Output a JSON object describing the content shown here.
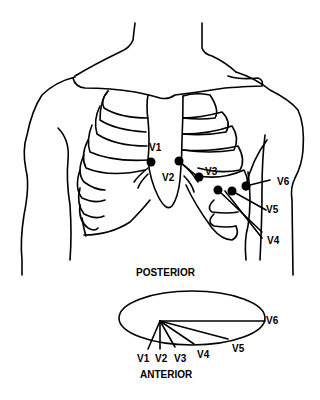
{
  "diagram": {
    "chest_leads": [
      {
        "id": "V1",
        "label": "V1"
      },
      {
        "id": "V2",
        "label": "V2"
      },
      {
        "id": "V3",
        "label": "V3"
      },
      {
        "id": "V4",
        "label": "V4"
      },
      {
        "id": "V5",
        "label": "V5"
      },
      {
        "id": "V6",
        "label": "V6"
      }
    ],
    "cross_section": {
      "top_label": "POSTERIOR",
      "bottom_label": "ANTERIOR",
      "leads": [
        {
          "label": "V1"
        },
        {
          "label": "V2"
        },
        {
          "label": "V3"
        },
        {
          "label": "V4"
        },
        {
          "label": "V5"
        },
        {
          "label": "V6"
        }
      ]
    },
    "colors": {
      "line": "#000000",
      "background": "#ffffff",
      "electrode": "#000000"
    }
  }
}
